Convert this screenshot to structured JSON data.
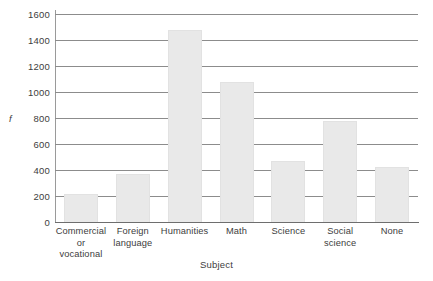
{
  "chart_data": {
    "type": "bar",
    "title": "",
    "xlabel": "Subject",
    "ylabel": "f",
    "categories": [
      "Commercial or vocational",
      "Foreign language",
      "Humanities",
      "Math",
      "Science",
      "Social science",
      "None"
    ],
    "category_label_lines": [
      [
        "Commercial",
        "or",
        "vocational"
      ],
      [
        "Foreign",
        "language"
      ],
      [
        "Humanities"
      ],
      [
        "Math"
      ],
      [
        "Science"
      ],
      [
        "Social",
        "science"
      ],
      [
        "None"
      ]
    ],
    "values": [
      215,
      370,
      1480,
      1080,
      470,
      775,
      425
    ],
    "ylim": [
      0,
      1600
    ],
    "ytick_values": [
      0,
      200,
      400,
      600,
      800,
      1000,
      1200,
      1400,
      1600
    ],
    "ytick_labels": [
      "0",
      "200",
      "400",
      "600",
      "800",
      "1000",
      "1200",
      "1400",
      "1600"
    ],
    "grid": "horizontal",
    "legend": "none",
    "colors": {
      "bar_fill": "#e9e9e9",
      "bar_edge": "#e2e2e2",
      "gridline": "#8c8c8c",
      "axis": "#6e6e6e",
      "text": "#3d3d3d",
      "background": "#ffffff"
    }
  }
}
